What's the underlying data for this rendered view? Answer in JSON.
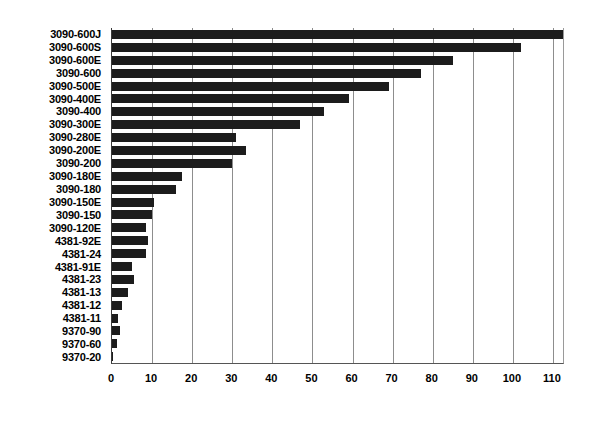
{
  "chart_data": {
    "type": "bar",
    "orientation": "horizontal",
    "title": "",
    "subtitle": "",
    "xlabel": "",
    "ylabel": "",
    "xlim": [
      0,
      113
    ],
    "ylim": null,
    "grid": true,
    "legend": null,
    "legend_position": "none",
    "bar_color": "#1c1c1c",
    "grid_color": "#8d8d8d",
    "axis_color": "#555555",
    "xticks": [
      0,
      10,
      20,
      30,
      40,
      50,
      60,
      70,
      80,
      90,
      100,
      110
    ],
    "xtick_labels": [
      "0",
      "10",
      "20",
      "30",
      "40",
      "50",
      "60",
      "70",
      "80",
      "90",
      "100",
      "110"
    ],
    "categories": [
      "3090-600J",
      "3090-600S",
      "3090-600E",
      "3090-600",
      "3090-500E",
      "3090-400E",
      "3090-400",
      "3090-300E",
      "3090-280E",
      "3090-200E",
      "3090-200",
      "3090-180E",
      "3090-180",
      "3090-150E",
      "3090-150",
      "3090-120E",
      "4381-92E",
      "4381-24",
      "4381-91E",
      "4381-23",
      "4381-13",
      "4381-12",
      "4381-11",
      "9370-90",
      "9370-60",
      "9370-20"
    ],
    "values": [
      113.0,
      102.0,
      85.0,
      77.0,
      69.0,
      59.0,
      53.0,
      47.0,
      31.0,
      33.5,
      30.0,
      17.5,
      16.0,
      10.5,
      10.0,
      8.5,
      9.0,
      8.5,
      5.0,
      5.5,
      4.0,
      2.5,
      1.5,
      2.0,
      1.2,
      0.2
    ]
  }
}
